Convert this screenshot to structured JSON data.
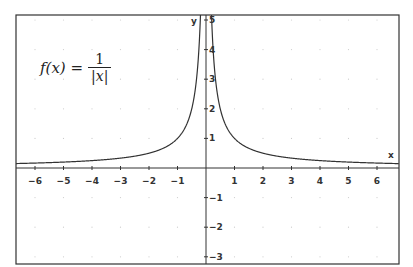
{
  "chart_data": {
    "type": "line",
    "formula": {
      "lhs": "f(x) =",
      "numerator": "1",
      "denominator": "|x|"
    },
    "xlabel": "x",
    "ylabel": "y",
    "xlim": [
      -6.6,
      6.8
    ],
    "ylim": [
      -3.2,
      5.2
    ],
    "x_ticks": [
      -6,
      -5,
      -4,
      -3,
      -2,
      -1,
      1,
      2,
      3,
      4,
      5,
      6
    ],
    "y_ticks": [
      5,
      4,
      3,
      2,
      1,
      -1,
      -2,
      -3
    ],
    "grid": "dotted faint",
    "series": [
      {
        "name": "f(x)=1/|x|",
        "function": "1/abs(x)",
        "x": [
          -6.5,
          -6,
          -5,
          -4,
          -3,
          -2,
          -1,
          -0.5,
          -0.25,
          0.25,
          0.5,
          1,
          2,
          3,
          4,
          5,
          6,
          6.5
        ],
        "y": [
          0.154,
          0.167,
          0.2,
          0.25,
          0.333,
          0.5,
          1,
          2,
          4,
          4,
          2,
          1,
          0.5,
          0.333,
          0.25,
          0.2,
          0.167,
          0.154
        ]
      }
    ],
    "colors": {
      "curve": "#333333",
      "axis": "#333333",
      "frame": "#333333",
      "grid": "#cccccc"
    }
  }
}
